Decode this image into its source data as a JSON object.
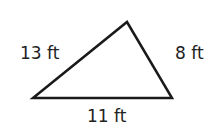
{
  "diagram": {
    "type": "triangle",
    "stroke_color": "#1a1a1a",
    "fill_color": "#ffffff",
    "vertices": {
      "left": [
        33,
        98
      ],
      "top": [
        127,
        22
      ],
      "right": [
        172,
        98
      ]
    },
    "sides": [
      {
        "id": "left-side",
        "label": "13 ft"
      },
      {
        "id": "right-side",
        "label": "8 ft"
      },
      {
        "id": "bottom-side",
        "label": "11 ft"
      }
    ]
  }
}
